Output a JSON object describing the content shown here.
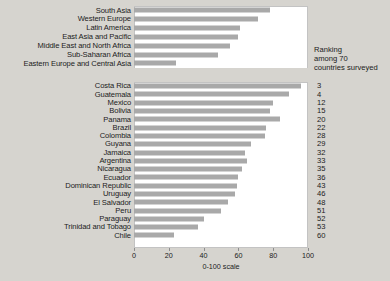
{
  "chart_data": {
    "type": "bar",
    "title": "",
    "xlabel": "0-100 scale",
    "ylabel": "",
    "xlim": [
      0,
      100
    ],
    "grid": false,
    "legend": null,
    "orientation": "horizontal",
    "axis_ticks": [
      0,
      20,
      40,
      60,
      80,
      100
    ],
    "panels": [
      {
        "name": "regions",
        "categories": [
          "South Asia",
          "Western Europe",
          "Latin America",
          "East Asia and Pacific",
          "Middle East and North Africa",
          "Sub-Saharan Africa",
          "Eastern Europe and Central Asia"
        ],
        "values": [
          78,
          71,
          61,
          60,
          55,
          48,
          24
        ]
      },
      {
        "name": "countries",
        "header": "Ranking among 70 countries surveyed",
        "categories": [
          "Costa Rica",
          "Guatemala",
          "Mexico",
          "Bolivia",
          "Panama",
          "Brazil",
          "Colombia",
          "Guyana",
          "Jamaica",
          "Argentina",
          "Nicaragua",
          "Ecuador",
          "Dominican Republic",
          "Uruguay",
          "El Salvador",
          "Peru",
          "Paraguay",
          "Trinidad and Tobago",
          "Chile"
        ],
        "values": [
          96,
          89,
          80,
          78,
          84,
          76,
          75,
          67,
          64,
          65,
          62,
          60,
          59,
          58,
          54,
          50,
          40,
          37,
          23
        ],
        "ranks": [
          3,
          4,
          12,
          15,
          20,
          22,
          28,
          29,
          32,
          33,
          35,
          36,
          43,
          46,
          48,
          51,
          52,
          53,
          60
        ]
      }
    ]
  },
  "caption": {
    "line1": "Ranking",
    "line2": "among 70",
    "line3": "countries surveyed"
  },
  "colors": {
    "bar": "#a9a9a9",
    "plot_background": "#ffffff",
    "page_background": "#d6d4cf",
    "text": "#1b1b1b",
    "axis": "#8d8d8d"
  }
}
